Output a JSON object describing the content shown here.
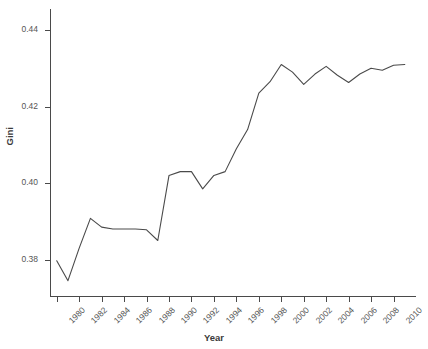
{
  "chart_data": {
    "type": "line",
    "title": "",
    "xlabel": "Year",
    "ylabel": "Gini",
    "xlim": [
      1979.4,
      2012.0
    ],
    "ylim": [
      0.3705,
      0.4455
    ],
    "grid": false,
    "legend": null,
    "line_color": "#4a4a4a",
    "x": [
      1980,
      1981,
      1982,
      1983,
      1984,
      1985,
      1986,
      1987,
      1988,
      1989,
      1990,
      1991,
      1992,
      1993,
      1994,
      1995,
      1996,
      1997,
      1998,
      1999,
      2000,
      2001,
      2002,
      2003,
      2004,
      2005,
      2006,
      2007,
      2008,
      2009,
      2010,
      2011
    ],
    "values": [
      0.3797,
      0.3745,
      0.383,
      0.3908,
      0.3885,
      0.388,
      0.388,
      0.388,
      0.3878,
      0.385,
      0.402,
      0.403,
      0.403,
      0.3985,
      0.402,
      0.403,
      0.409,
      0.414,
      0.4235,
      0.4265,
      0.431,
      0.429,
      0.4258,
      0.4285,
      0.4305,
      0.4282,
      0.4263,
      0.4285,
      0.43,
      0.4295,
      0.4308,
      0.431
    ],
    "xticks": [
      1980,
      1982,
      1984,
      1986,
      1988,
      1990,
      1992,
      1994,
      1996,
      1998,
      2000,
      2002,
      2004,
      2006,
      2008,
      2010
    ],
    "xtick_labels": [
      "1980",
      "1982",
      "1984",
      "1986",
      "1988",
      "1990",
      "1992",
      "1994",
      "1996",
      "1998",
      "2000",
      "2002",
      "2004",
      "2006",
      "2008",
      "2010"
    ],
    "yticks": [
      0.38,
      0.4,
      0.42,
      0.44
    ],
    "ytick_labels": [
      "0.38",
      "0.40",
      "0.42",
      "0.44"
    ]
  }
}
